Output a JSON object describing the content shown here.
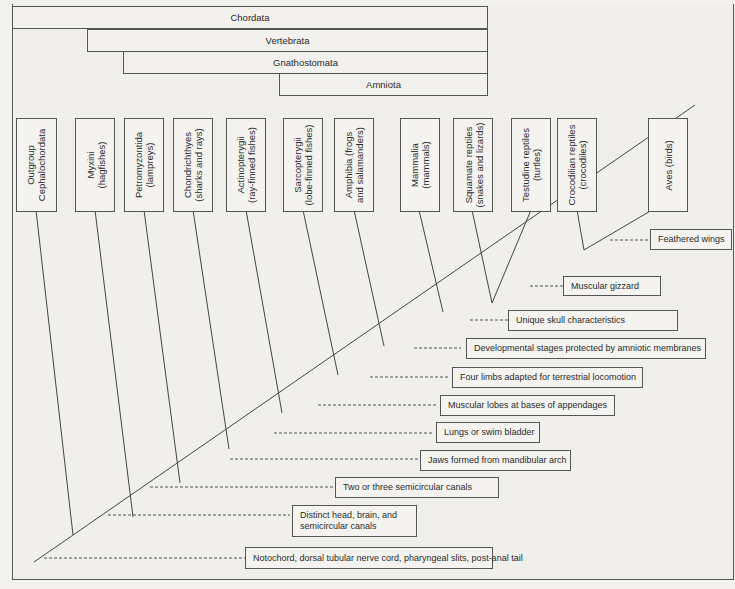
{
  "clades": [
    {
      "name": "Chordata"
    },
    {
      "name": "Vertebrata"
    },
    {
      "name": "Gnathostomata"
    },
    {
      "name": "Amniota"
    }
  ],
  "taxa": [
    {
      "label": "Outgroup\nCephalochordata"
    },
    {
      "label": "Myxini\n(hagfishes)"
    },
    {
      "label": "Petromyzontida\n(lampreys)"
    },
    {
      "label": "Chondrichthyes\n(sharks and rays)"
    },
    {
      "label": "Actinopterygii\n(ray-finned fishes)"
    },
    {
      "label": "Sarcopterygii\n(lobe-finned fishes)"
    },
    {
      "label": "Amphibia (frogs\nand salamanders)"
    },
    {
      "label": "Mammalia\n(mammals)"
    },
    {
      "label": "Squamate reptiles\n(snakes and lizards)"
    },
    {
      "label": "Testudine reptiles\n(turtles)"
    },
    {
      "label": "Crocodilian reptiles\n(crocodiles)"
    },
    {
      "label": "Aves (birds)"
    }
  ],
  "traits": [
    {
      "label": "Feathered wings"
    },
    {
      "label": "Muscular gizzard"
    },
    {
      "label": "Unique skull characteristics"
    },
    {
      "label": "Developmental stages protected by amniotic membranes"
    },
    {
      "label": "Four limbs adapted for terrestrial locomotion"
    },
    {
      "label": "Muscular lobes at bases of appendages"
    },
    {
      "label": "Lungs or swim bladder"
    },
    {
      "label": "Jaws formed from mandibular arch"
    },
    {
      "label": "Two or three semicircular canals"
    },
    {
      "label": "Distinct head, brain, and\nsemicircular canals"
    },
    {
      "label": "Notochord, dorsal tubular nerve cord, pharyngeal slits, post-anal tail"
    }
  ]
}
